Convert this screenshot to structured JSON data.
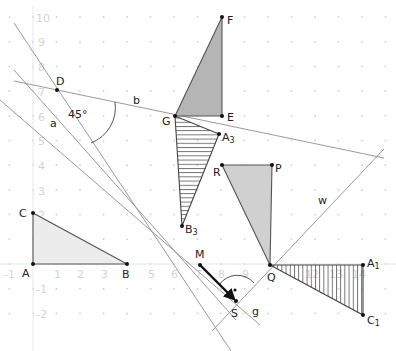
{
  "diagram": {
    "type": "coordinate-geometry",
    "axes": {
      "x_ticks": [
        "-1",
        "1",
        "2",
        "3",
        "5",
        "6",
        "7",
        "8",
        "9",
        "12",
        "13",
        "14"
      ],
      "y_ticks": [
        "10",
        "9",
        "8",
        "7",
        "6",
        "5",
        "4",
        "3",
        "2",
        "1",
        "-1",
        "-2"
      ],
      "x_range": [
        -1,
        14
      ],
      "y_range": [
        -2,
        10
      ]
    },
    "points": {
      "A": "A",
      "B": "B",
      "C": "C",
      "D": "D",
      "G": "G",
      "E": "E",
      "F": "F",
      "A3": "A",
      "A3_sub": "3",
      "B3": "B",
      "B3_sub": "3",
      "R": "R",
      "P": "P",
      "Q": "Q",
      "A1": "A",
      "A1_sub": "1",
      "C1": "C",
      "C1_sub": "1",
      "M": "M",
      "S": "S"
    },
    "lines": {
      "a": "a",
      "b": "b",
      "w": "w",
      "g": "g"
    },
    "angle_label": "45°",
    "shapes": [
      {
        "name": "triangle ABC",
        "fill": "light-gray"
      },
      {
        "name": "triangle GEF",
        "fill": "dark-gray"
      },
      {
        "name": "triangle G A3 B3",
        "fill": "horizontal-hatch"
      },
      {
        "name": "triangle R P Q",
        "fill": "gray"
      },
      {
        "name": "triangle Q A1 C1",
        "fill": "vertical-hatch"
      }
    ],
    "vector": {
      "from": "M",
      "to": "S"
    },
    "colors": {
      "grid": "#d9d9d9",
      "line": "#9a9a9a",
      "edge": "#555555",
      "fill_light": "#ececec",
      "fill_dark": "#b5b5b5",
      "fill_mid": "#d0d0d0",
      "point": "#111111"
    }
  }
}
